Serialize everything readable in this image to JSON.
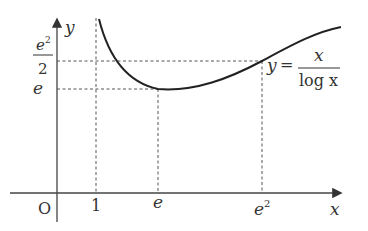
{
  "figure": {
    "function_label": {
      "lhs": "y",
      "eq": "=",
      "numerator": "x",
      "denominator": "log x"
    },
    "axes": {
      "x_label": "x",
      "y_label": "y",
      "origin_label": "O"
    },
    "x_ticks": [
      {
        "label": "1"
      },
      {
        "label": "e"
      },
      {
        "label_base": "e",
        "label_sup": "2"
      }
    ],
    "y_ticks": [
      {
        "label": "e"
      },
      {
        "numerator_base": "e",
        "numerator_sup": "2",
        "denominator": "2"
      }
    ],
    "colors": {
      "curve": "#222222",
      "axis": "#444444",
      "dashed": "#555555",
      "text": "#333333"
    }
  }
}
